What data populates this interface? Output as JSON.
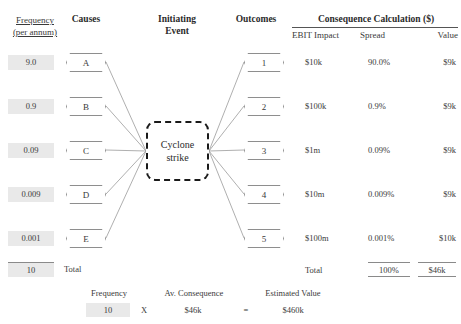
{
  "headers": {
    "frequency_line1": "Frequency",
    "frequency_line2": "(per annum)",
    "causes": "Causes",
    "initiating_event_line1": "Initiating",
    "initiating_event_line2": "Event",
    "outcomes": "Outcomes",
    "consequence_calculation": "Consequence Calculation ($)",
    "ebit_impact": "EBIT Impact",
    "spread": "Spread",
    "value": "Value"
  },
  "initiating_event": {
    "label_line1": "Cyclone",
    "label_line2": "strike"
  },
  "rows": [
    {
      "frequency": "9.0",
      "cause": "A",
      "outcome": "1",
      "ebit_impact": "$10k",
      "spread": "90.0%",
      "value": "$9k"
    },
    {
      "frequency": "0.9",
      "cause": "B",
      "outcome": "2",
      "ebit_impact": "$100k",
      "spread": "0.9%",
      "value": "$9k"
    },
    {
      "frequency": "0.09",
      "cause": "C",
      "outcome": "3",
      "ebit_impact": "$1m",
      "spread": "0.09%",
      "value": "$9k"
    },
    {
      "frequency": "0.009",
      "cause": "D",
      "outcome": "4",
      "ebit_impact": "$10m",
      "spread": "0.009%",
      "value": "$9k"
    },
    {
      "frequency": "0.001",
      "cause": "E",
      "outcome": "5",
      "ebit_impact": "$100m",
      "spread": "0.001%",
      "value": "$10k"
    }
  ],
  "totals": {
    "frequency_value": "10",
    "frequency_label": "Total",
    "consequence_label": "Total",
    "spread_total": "100%",
    "value_total": "$46k"
  },
  "summary": {
    "frequency_label": "Frequency",
    "frequency_value": "10",
    "operator_multiply": "X",
    "av_consequence_label": "Av. Consequence",
    "av_consequence_value": "$46k",
    "operator_equals": "=",
    "estimated_value_label": "Estimated Value",
    "estimated_value": "$460k"
  },
  "colors": {
    "shade": "#e9e9e9",
    "text": "#3a3a3a",
    "heading": "#2b2b2b",
    "node_border": "#8e8e8e",
    "event_border": "#1a1a1a",
    "wire": "#9a9a9a"
  }
}
